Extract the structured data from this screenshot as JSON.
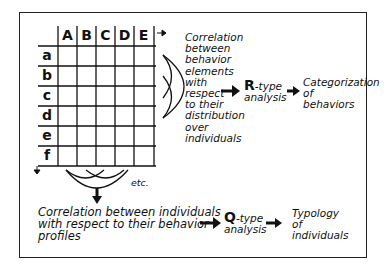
{
  "grid": {
    "column_headers": [
      "A",
      "B",
      "C",
      "D",
      "E"
    ],
    "row_headers": [
      "a",
      "b",
      "c",
      "d",
      "e",
      "f"
    ]
  },
  "r_branch": {
    "correlation_text": "Correlation\nbetween\nbehavior\nelements\nwith\nrespect\nto their\ndistribution\nover\nindividuals",
    "analysis_letter": "R",
    "analysis_suffix": "-type",
    "analysis_word": "analysis",
    "result_text": "Categorization\nof\nbehaviors"
  },
  "q_branch": {
    "etc_label": "etc.",
    "correlation_text": "Correlation between individuals\nwith respect to their behavior\nprofiles",
    "analysis_letter": "Q",
    "analysis_suffix": "-type",
    "analysis_word": "analysis",
    "result_text": "Typology\nof\nindividuals"
  },
  "colors": {
    "ink": "#111111",
    "background": "#ffffff"
  }
}
